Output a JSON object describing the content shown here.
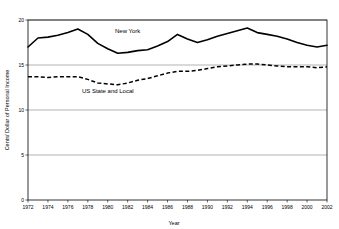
{
  "chart_data": {
    "type": "line",
    "title": "",
    "xlabel": "Year",
    "ylabel": "Cents/ Dollar of Personal Income",
    "xlim": [
      1972,
      2002
    ],
    "ylim": [
      0,
      20
    ],
    "ytick_step": 5,
    "xtick_step": 2,
    "grid": true,
    "legend_position": "inline-annotation",
    "yticks": [
      "0",
      "5",
      "10",
      "15",
      "20"
    ],
    "xticks": [
      "1972",
      "1974",
      "1976",
      "1978",
      "1980",
      "1982",
      "1984",
      "1986",
      "1988",
      "1990",
      "1992",
      "1994",
      "1996",
      "1998",
      "2000",
      "2002"
    ],
    "x": [
      1972,
      1973,
      1974,
      1975,
      1976,
      1977,
      1978,
      1979,
      1980,
      1981,
      1982,
      1983,
      1984,
      1985,
      1986,
      1987,
      1988,
      1989,
      1990,
      1991,
      1992,
      1993,
      1994,
      1995,
      1996,
      1997,
      1998,
      1999,
      2000,
      2001,
      2002
    ],
    "series": [
      {
        "name": "New York",
        "style": "solid",
        "color": "#000000",
        "label_x": 1982,
        "label_y": 18.6,
        "values": [
          17.0,
          18.0,
          18.1,
          18.3,
          18.6,
          19.0,
          18.4,
          17.4,
          16.8,
          16.3,
          16.4,
          16.6,
          16.7,
          17.1,
          17.6,
          18.4,
          17.9,
          17.5,
          17.8,
          18.2,
          18.5,
          18.8,
          19.1,
          18.6,
          18.4,
          18.2,
          17.9,
          17.5,
          17.2,
          17.0,
          17.2
        ]
      },
      {
        "name": "US State and Local",
        "style": "dashed",
        "color": "#000000",
        "label_x": 1980,
        "label_y": 11.9,
        "values": [
          13.7,
          13.7,
          13.6,
          13.7,
          13.7,
          13.7,
          13.4,
          13.0,
          12.9,
          12.8,
          13.0,
          13.3,
          13.5,
          13.8,
          14.1,
          14.3,
          14.3,
          14.4,
          14.6,
          14.8,
          14.9,
          15.0,
          15.1,
          15.1,
          15.0,
          14.9,
          14.8,
          14.8,
          14.8,
          14.7,
          14.8
        ]
      }
    ]
  },
  "labels": {
    "series_new_york": "New York",
    "series_us_state_local": "US State and Local",
    "xlabel": "Year",
    "ylabel": "Cents/ Dollar of Personal Income"
  }
}
